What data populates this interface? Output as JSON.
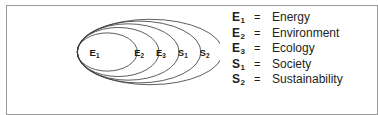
{
  "figure": {
    "kind": "nested-ellipse-containment-diagram",
    "border_color": "#9a9a9a",
    "stroke_color": "#3a3a3a",
    "text_color": "#231f20",
    "background_color": "#ffffff"
  },
  "diagram": {
    "label": "nested ellipses diagram",
    "equals_sign": "=",
    "ellipses": [
      {
        "id": "E1",
        "symbol": "E",
        "subscript": "1",
        "label": "E₁",
        "rx": 33,
        "ry": 21,
        "cx": 96,
        "cy": 46,
        "level": 1
      },
      {
        "id": "E2",
        "symbol": "E",
        "subscript": "2",
        "label": "E₂",
        "rx": 45,
        "ry": 27,
        "cx": 108,
        "cy": 46,
        "level": 2
      },
      {
        "id": "E3",
        "symbol": "E",
        "subscript": "3",
        "label": "E₃",
        "rx": 56,
        "ry": 31,
        "cx": 119,
        "cy": 46,
        "level": 3
      },
      {
        "id": "S1",
        "symbol": "S",
        "subscript": "1",
        "label": "S₁",
        "rx": 68,
        "ry": 34,
        "cx": 131,
        "cy": 46,
        "level": 4
      },
      {
        "id": "S2",
        "symbol": "S",
        "subscript": "2",
        "label": "S₂",
        "rx": 80,
        "ry": 36,
        "cx": 143,
        "cy": 46,
        "level": 5
      }
    ],
    "label_positions": [
      {
        "id": "E1",
        "x": 82,
        "y": 50
      },
      {
        "id": "E2",
        "x": 131,
        "y": 50
      },
      {
        "id": "E3",
        "x": 155,
        "y": 50
      },
      {
        "id": "S1",
        "x": 179,
        "y": 50
      },
      {
        "id": "S2",
        "x": 203,
        "y": 50
      }
    ]
  },
  "legend": {
    "equals": "=",
    "rows": [
      {
        "symbol": "E",
        "subscript": "1",
        "equals": "=",
        "term": "Energy"
      },
      {
        "symbol": "E",
        "subscript": "2",
        "equals": "=",
        "term": "Environment"
      },
      {
        "symbol": "E",
        "subscript": "3",
        "equals": "=",
        "term": "Ecology"
      },
      {
        "symbol": "S",
        "subscript": "1",
        "equals": "=",
        "term": "Society"
      },
      {
        "symbol": "S",
        "subscript": "2",
        "equals": "=",
        "term": "Sustainability"
      }
    ]
  }
}
